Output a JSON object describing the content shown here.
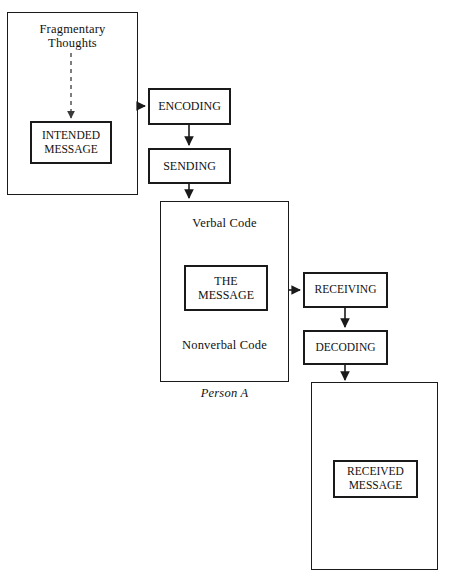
{
  "diagram": {
    "canvas": {
      "width": 450,
      "height": 576
    },
    "stroke_color": "#1a1a1a",
    "background_color": "#ffffff"
  },
  "nodes": {
    "fragmentary_thoughts": "Fragmentary\nThoughts",
    "intended_message": "INTENDED\nMESSAGE",
    "encoding": "ENCODING",
    "sending": "SENDING",
    "verbal_code": "Verbal Code",
    "the_message": "THE\nMESSAGE",
    "nonverbal_code": "Nonverbal Code",
    "person_a": "Person A",
    "receiving": "RECEIVING",
    "decoding": "DECODING",
    "received_message": "RECEIVED\nMESSAGE"
  },
  "connections": [
    {
      "from": "fragmentary_thoughts",
      "to": "intended_message",
      "style": "dashed",
      "direction": "down"
    },
    {
      "from": "sender_container",
      "to": "encoding",
      "style": "solid",
      "direction": "right"
    },
    {
      "from": "encoding",
      "to": "sending",
      "style": "solid",
      "direction": "down"
    },
    {
      "from": "sending",
      "to": "person_a_container",
      "style": "solid",
      "direction": "down"
    },
    {
      "from": "person_a_container",
      "to": "receiving",
      "style": "solid",
      "direction": "right"
    },
    {
      "from": "receiving",
      "to": "decoding",
      "style": "solid",
      "direction": "down"
    },
    {
      "from": "decoding",
      "to": "receiver_container",
      "style": "solid",
      "direction": "down"
    }
  ]
}
